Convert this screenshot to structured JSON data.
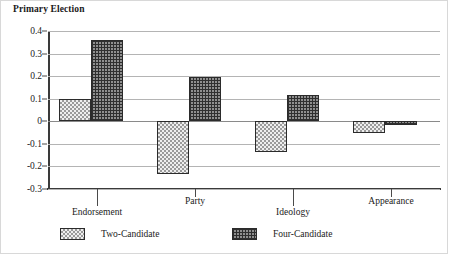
{
  "chart_data": {
    "type": "bar",
    "title": "Primary Election",
    "xlabel": "",
    "ylabel": "",
    "ylim": [
      -0.3,
      0.4
    ],
    "ytick_labels": [
      "0.4",
      "0.3",
      "0.2",
      "0.1",
      "0",
      "-0.1",
      "-0.2",
      "-0.3"
    ],
    "ytick_values": [
      0.4,
      0.3,
      0.2,
      0.1,
      0,
      -0.1,
      -0.2,
      -0.3
    ],
    "grid": true,
    "legend_position": "bottom",
    "categories": [
      "Endorsement",
      "Party",
      "Ideology",
      "Appearance"
    ],
    "series": [
      {
        "name": "Two-Candidate",
        "pattern": "light-checkerboard",
        "values": [
          0.1,
          -0.235,
          -0.135,
          -0.05
        ]
      },
      {
        "name": "Four-Candidate",
        "pattern": "dense-crosshatch",
        "values": [
          0.36,
          0.195,
          0.115,
          -0.015
        ]
      }
    ]
  },
  "colors": {
    "axis": "#3a3a3a",
    "gridline": "#b4b4b4",
    "zero_line": "#8a8a8a",
    "bar_outline": "#2b2b2b",
    "two_candidate_fill": "#d8d8d8",
    "four_candidate_fill": "#8f8f8f",
    "frame": "#d8d8d8"
  }
}
